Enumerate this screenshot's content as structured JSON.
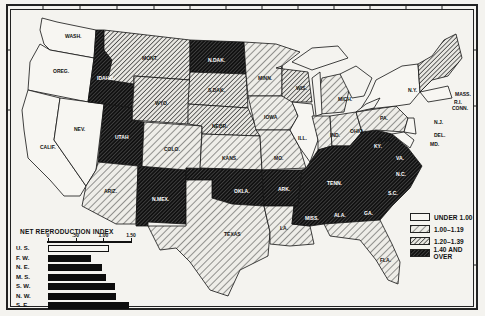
{
  "map": {
    "legend": {
      "items": [
        {
          "label": "UNDER 1.00",
          "pattern": "none"
        },
        {
          "label": "1.00–1.19",
          "pattern": "light-hatch"
        },
        {
          "label": "1.20–1.39",
          "pattern": "medium-hatch"
        },
        {
          "label": "1.40 AND OVER",
          "pattern": "dense-hatch"
        }
      ]
    },
    "states": {
      "wash": "WASH.",
      "oreg": "OREG.",
      "calif": "CALIF.",
      "nev": "NEV.",
      "idaho": "IDAHO",
      "mont": "MONT.",
      "wyo": "WYO.",
      "utah": "UTAH",
      "ariz": "ARIZ.",
      "colo": "COLO.",
      "nmex": "N.MEX.",
      "ndak": "N.DAK.",
      "sdak": "S.DAK.",
      "nebr": "NEBR.",
      "kans": "KANS.",
      "okla": "OKLA.",
      "texas": "TEXAS",
      "minn": "MINN.",
      "iowa": "IOWA",
      "mo": "MO.",
      "ark": "ARK.",
      "la": "LA.",
      "wis": "WIS.",
      "ill": "ILL.",
      "mich": "MICH.",
      "ind": "IND.",
      "ohio": "OHIO",
      "ky": "KY.",
      "tenn": "TENN.",
      "miss": "MISS.",
      "ala": "ALA.",
      "ga": "GA.",
      "fla": "FLA.",
      "sc": "S.C.",
      "nc": "N.C.",
      "va": "VA.",
      "wva": "W.VA.",
      "pa": "PA.",
      "ny": "N.Y.",
      "nj": "N.J.",
      "del": "DEL.",
      "md": "MD.",
      "conn": "CONN.",
      "ri": "R.I.",
      "mass": "MASS.",
      "vt": "VT.",
      "nh": "N.H.",
      "me": "ME."
    }
  },
  "chart_data": {
    "type": "bar",
    "orientation": "horizontal",
    "title": "NET REPRODUCTION INDEX",
    "categories": [
      "U. S.",
      "F. W.",
      "N. E.",
      "M. S.",
      "S. W.",
      "N. W.",
      "S. E."
    ],
    "values": [
      1.1,
      0.78,
      0.98,
      1.05,
      1.21,
      1.23,
      1.47
    ],
    "bar_styles": [
      "open",
      "filled",
      "filled",
      "filled",
      "filled",
      "filled",
      "filled"
    ],
    "xticks": [
      "0",
      ".50",
      "1.00",
      "1.50"
    ],
    "xlim": [
      0,
      1.5
    ],
    "xlabel": "",
    "ylabel": "",
    "grid": false
  }
}
